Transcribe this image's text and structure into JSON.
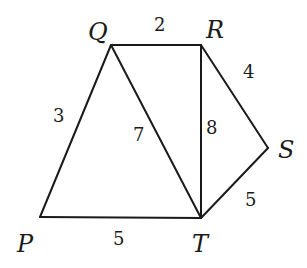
{
  "diagram": {
    "vertices": {
      "P": {
        "label": "P",
        "x": 40,
        "y": 217
      },
      "Q": {
        "label": "Q",
        "x": 111,
        "y": 45
      },
      "R": {
        "label": "R",
        "x": 201,
        "y": 45
      },
      "S": {
        "label": "S",
        "x": 268,
        "y": 148
      },
      "T": {
        "label": "T",
        "x": 201,
        "y": 218
      }
    },
    "edges": {
      "QR": {
        "from": "Q",
        "to": "R",
        "label": "2"
      },
      "PQ": {
        "from": "P",
        "to": "Q",
        "label": "3"
      },
      "RS": {
        "from": "R",
        "to": "S",
        "label": "4"
      },
      "PT": {
        "from": "P",
        "to": "T",
        "label": "5"
      },
      "ST": {
        "from": "S",
        "to": "T",
        "label": "5"
      },
      "QT": {
        "from": "Q",
        "to": "T",
        "label": "7"
      },
      "RT": {
        "from": "R",
        "to": "T",
        "label": "8"
      }
    }
  }
}
